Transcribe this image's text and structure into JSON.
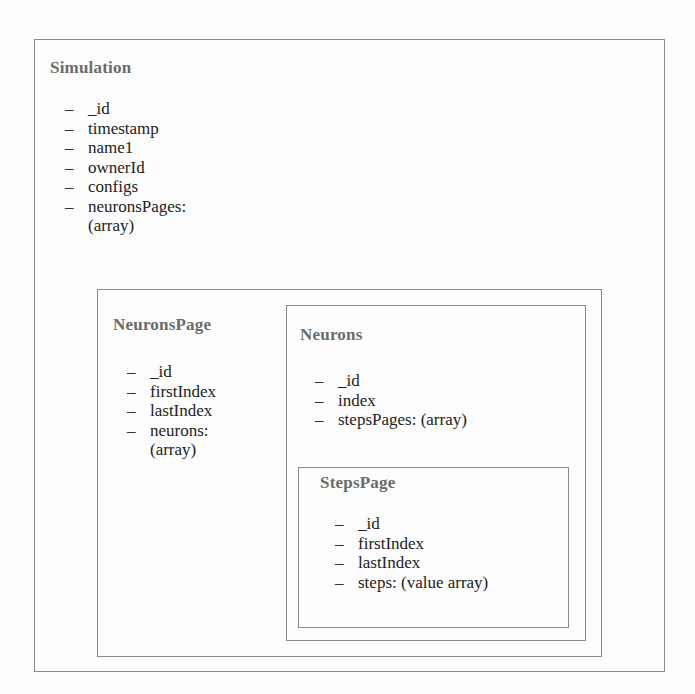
{
  "diagram": {
    "simulation": {
      "title": "Simulation",
      "fields": [
        "_id",
        "timestamp",
        "name1",
        "ownerId",
        "configs",
        "neuronsPages:"
      ],
      "continuation": "(array)"
    },
    "neurons_page": {
      "title": "NeuronsPage",
      "fields": [
        "_id",
        "firstIndex",
        "lastIndex",
        "neurons:"
      ],
      "continuation": "(array)"
    },
    "neurons": {
      "title": "Neurons",
      "fields": [
        "_id",
        "index",
        "stepsPages: (array)"
      ]
    },
    "steps_page": {
      "title": "StepsPage",
      "fields": [
        "_id",
        "firstIndex",
        "lastIndex",
        "steps: (value array)"
      ]
    },
    "bullet": "–",
    "colors": {
      "border": "#8a8a8a",
      "title": "#6b6b6b",
      "text": "#222222",
      "background": "#fdfdfd"
    }
  }
}
